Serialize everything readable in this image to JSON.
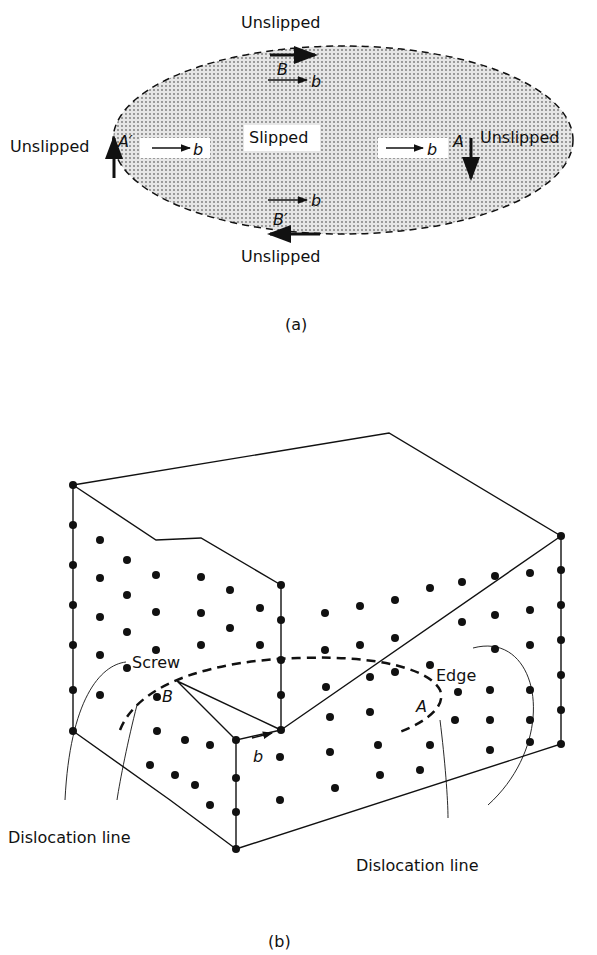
{
  "figure_a": {
    "caption": "(a)",
    "center_label": "Slipped",
    "outside_labels": {
      "top": "Unslipped",
      "bottom": "Unslipped",
      "left": "Unslipped",
      "right": "Unslipped"
    },
    "points": {
      "B": "B",
      "B_prime": "B′",
      "A": "A",
      "A_prime": "A′"
    },
    "burgers_label": "b"
  },
  "figure_b": {
    "caption": "(b)",
    "labels": {
      "screw": "Screw",
      "edge": "Edge",
      "B": "B",
      "A": "A",
      "b": "b",
      "dislocation_left": "Dislocation line",
      "dislocation_right": "Dislocation line"
    }
  }
}
